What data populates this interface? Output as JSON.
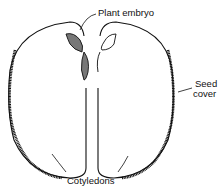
{
  "diagram": {
    "labels": {
      "embryo": "Plant embryo",
      "seed_cover_line1": "Seed",
      "seed_cover_line2": "cover",
      "cotyledons": "Cotyledons"
    },
    "colors": {
      "stroke": "#111111",
      "embryo_fill": "#777777",
      "background": "#ffffff"
    }
  }
}
